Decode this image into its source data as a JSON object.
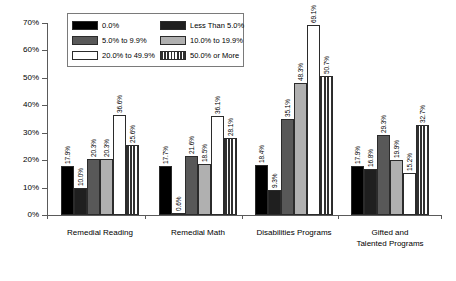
{
  "chart_data": {
    "type": "bar",
    "title": "",
    "xlabel": "",
    "ylabel": "",
    "ylim": [
      0,
      70
    ],
    "ytick_labels": [
      "0%",
      "10%",
      "20%",
      "30%",
      "40%",
      "50%",
      "60%",
      "70%"
    ],
    "ytick_values": [
      0,
      10,
      20,
      30,
      40,
      50,
      60,
      70
    ],
    "grid": false,
    "legend_position": "top-left-inside",
    "categories": [
      "Remedial Reading",
      "Remedial Math",
      "Disabilities Programs",
      "Gifted and Talented Programs"
    ],
    "category_lines": [
      [
        "Remedial Reading"
      ],
      [
        "Remedial Math"
      ],
      [
        "Disabilities Programs"
      ],
      [
        "Gifted and",
        "Talented Programs"
      ]
    ],
    "series": [
      {
        "name": "0.0%",
        "color": "#000000",
        "pattern": "solid",
        "values": [
          17.9,
          17.7,
          18.4,
          17.9
        ],
        "labels": [
          "17.9%",
          "17.7%",
          "18.4%",
          "17.9%"
        ]
      },
      {
        "name": "Less Than 5.0%",
        "color": "#1f1f1f",
        "pattern": "solid",
        "values": [
          10.0,
          0.6,
          9.3,
          16.8
        ],
        "labels": [
          "10.0%",
          "0.6%",
          "9.3%",
          "16.8%"
        ]
      },
      {
        "name": "5.0% to 9.9%",
        "color": "#585858",
        "pattern": "solid",
        "values": [
          20.3,
          21.6,
          35.1,
          29.3
        ],
        "labels": [
          "20.3%",
          "21.6%",
          "35.1%",
          "29.3%"
        ]
      },
      {
        "name": "10.0% to 19.9%",
        "color": "#b0b0b0",
        "pattern": "solid",
        "values": [
          20.3,
          18.5,
          48.3,
          19.9
        ],
        "labels": [
          "20.3%",
          "18.5%",
          "48.3%",
          "19.9%"
        ]
      },
      {
        "name": "20.0% to 49.9%",
        "color": "#ffffff",
        "pattern": "solid",
        "values": [
          36.6,
          36.1,
          69.1,
          15.2
        ],
        "labels": [
          "36.6%",
          "36.1%",
          "69.1%",
          "15.2%"
        ]
      },
      {
        "name": "50.0% or More",
        "color": "#ffffff",
        "pattern": "vertical-stripes",
        "values": [
          25.6,
          28.1,
          50.7,
          32.7
        ],
        "labels": [
          "25.6%",
          "28.1%",
          "50.7%",
          "32.7%"
        ]
      }
    ]
  },
  "legend": {
    "items": [
      {
        "label": "0.0%"
      },
      {
        "label": "Less Than 5.0%"
      },
      {
        "label": "5.0% to 9.9%"
      },
      {
        "label": "10.0% to 19.9%"
      },
      {
        "label": "20.0% to 49.9%"
      },
      {
        "label": "50.0% or More"
      }
    ]
  }
}
